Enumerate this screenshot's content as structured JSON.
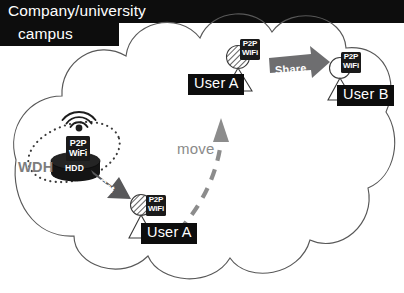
{
  "figure": {
    "campus_label": {
      "line1": "Company/university",
      "line2": "campus"
    },
    "wdh": {
      "name": "WDH",
      "p2p_line1": "P2P",
      "p2p_line2": "WiFi",
      "storage_label": "HDD"
    },
    "nodes": [
      {
        "id": "user-a-top",
        "label": "User A",
        "p2p_line1": "P2P",
        "p2p_line2": "WiFi",
        "head_style": "hatched"
      },
      {
        "id": "user-b",
        "label": "User B",
        "p2p_line1": "P2P",
        "p2p_line2": "WiFi",
        "head_style": "plain"
      },
      {
        "id": "user-a-bottom",
        "label": "User A",
        "p2p_line1": "P2P",
        "p2p_line2": "WiFi",
        "head_style": "hatched"
      }
    ],
    "actions": {
      "get": "Get",
      "share": "Share",
      "move": "move"
    },
    "colors": {
      "label_bg": "#0d0d0d",
      "label_text": "#ffffff",
      "cloud_stroke": "#4d4d4d",
      "wdh_text": "#7d7d7d",
      "move_text": "#8a8a8a",
      "get_arrow": "#58585a",
      "share_arrow": "#6e6e70",
      "move_arrow": "#8c8c8c",
      "coverage_dots": "#3b3b3b",
      "device_body": "#141414"
    }
  }
}
